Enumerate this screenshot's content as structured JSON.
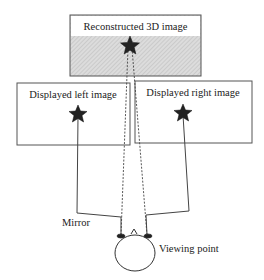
{
  "diagram": {
    "top_box": {
      "label": "Reconstructed 3D image"
    },
    "left_box": {
      "label": "Displayed left image"
    },
    "right_box": {
      "label": "Displayed right image"
    },
    "mirror_label": "Mirror",
    "viewer_label": "Viewing point"
  },
  "colors": {
    "line": "#333333",
    "hatch_bg": "#d8d8d8",
    "star": "#222222"
  }
}
